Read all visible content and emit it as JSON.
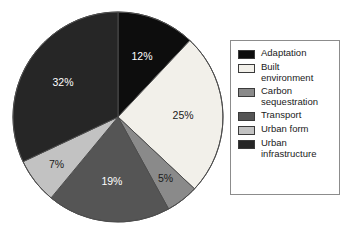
{
  "chart_data": {
    "type": "pie",
    "title": "",
    "subtitle": "",
    "xlabel": "",
    "ylabel": "",
    "legend_position": "right",
    "grid": false,
    "start_angle_oclock": 12,
    "direction": "clockwise",
    "categories": [
      "Adaptation",
      "Built environment",
      "Carbon sequestration",
      "Transport",
      "Urban form",
      "Urban infrastructure"
    ],
    "values": [
      12,
      25,
      5,
      19,
      7,
      32
    ],
    "value_unit": "%",
    "data_labels": [
      "12%",
      "25%",
      "5%",
      "19%",
      "7%",
      "32%"
    ],
    "colors": [
      "#0d0d0d",
      "#f2f0ea",
      "#8a8a8a",
      "#555555",
      "#c2c2c2",
      "#262626"
    ],
    "label_colors": [
      "#ffffff",
      "#1a1a1a",
      "#1a1a1a",
      "#ffffff",
      "#1a1a1a",
      "#ffffff"
    ]
  },
  "legend": {
    "entries": [
      {
        "label": "Adaptation",
        "swatch": "#0d0d0d"
      },
      {
        "label": "Built\nenvironment",
        "swatch": "#f2f0ea"
      },
      {
        "label": "Carbon\nsequestration",
        "swatch": "#8a8a8a"
      },
      {
        "label": "Transport",
        "swatch": "#555555"
      },
      {
        "label": "Urban form",
        "swatch": "#c2c2c2"
      },
      {
        "label": "Urban\ninfrastructure",
        "swatch": "#262626"
      }
    ]
  },
  "pie_geometry": {
    "center_x": 118,
    "center_y": 117,
    "radius": 105,
    "outline_color": "#4d4d4d"
  }
}
